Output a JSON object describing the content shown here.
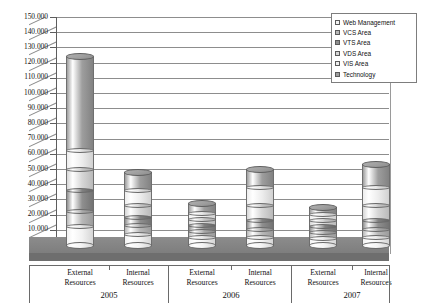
{
  "chart_data": {
    "type": "bar",
    "subtype": "stacked-cylinder-3d",
    "title": "",
    "xlabel": "",
    "ylabel": "",
    "ylim": [
      0,
      150000
    ],
    "ytick_step": 10000,
    "ytick_labels": [
      "150.000",
      "140.000",
      "130.000",
      "120.000",
      "110.000",
      "100.000",
      "90.000",
      "80.000",
      "70.000",
      "60.000",
      "50.000",
      "40.000",
      "30.000",
      "20.000",
      "10.000",
      "-"
    ],
    "ytick_values": [
      150000,
      140000,
      130000,
      120000,
      110000,
      100000,
      90000,
      80000,
      70000,
      60000,
      50000,
      40000,
      30000,
      20000,
      10000,
      0
    ],
    "grid": true,
    "legend_position": "top-right",
    "categories": [
      "External Resources",
      "Internal Resources",
      "External Resources",
      "Internal Resources",
      "External Resources",
      "Internal Resources"
    ],
    "groups": [
      {
        "year": "2005",
        "categories": [
          "External Resources",
          "Internal Resources"
        ]
      },
      {
        "year": "2006",
        "categories": [
          "External Resources",
          "Internal Resources"
        ]
      },
      {
        "year": "2007",
        "categories": [
          "External Resources",
          "Internal Resources"
        ]
      }
    ],
    "series": [
      {
        "name": "Web Management",
        "color": "#f2f2f2",
        "values": [
          12000,
          7000,
          5000,
          5000,
          4000,
          5000
        ]
      },
      {
        "name": "VCS Area",
        "color": "#b8b8b8",
        "values": [
          10000,
          6000,
          4000,
          5000,
          4000,
          5000
        ]
      },
      {
        "name": "VTS Area",
        "color": "#8f8f8f",
        "values": [
          14000,
          5000,
          4000,
          6000,
          4000,
          6000
        ]
      },
      {
        "name": "VDS Area",
        "color": "#d6d6d6",
        "values": [
          14000,
          8000,
          4000,
          10000,
          4000,
          10000
        ]
      },
      {
        "name": "VIS Area",
        "color": "#ededed",
        "values": [
          12000,
          10000,
          4000,
          12000,
          4000,
          12000
        ]
      },
      {
        "name": "Technology",
        "color": "#9e9e9e",
        "values": [
          62000,
          12000,
          6000,
          12000,
          5000,
          15000
        ]
      }
    ],
    "totals": [
      124000,
      48000,
      27000,
      50000,
      25000,
      53000
    ]
  },
  "legend": {
    "items": [
      {
        "label": "Web Management"
      },
      {
        "label": "VCS Area"
      },
      {
        "label": "VTS Area"
      },
      {
        "label": "VDS Area"
      },
      {
        "label": "VIS Area"
      },
      {
        "label": "Technology"
      }
    ]
  },
  "axis": {
    "y_labels": [
      "150.000",
      "140.000",
      "130.000",
      "120.000",
      "110.000",
      "100.000",
      "90.000",
      "80.000",
      "70.000",
      "60.000",
      "50.000",
      "40.000",
      "30.000",
      "20.000",
      "10.000",
      "-"
    ],
    "x_groups": [
      {
        "year": "2005",
        "left": "External Resources",
        "right": "Internal Resources"
      },
      {
        "year": "2006",
        "left": "External Resources",
        "right": "Internal Resources"
      },
      {
        "year": "2007",
        "left": "External Resources",
        "right": "Internal Resources"
      }
    ]
  }
}
